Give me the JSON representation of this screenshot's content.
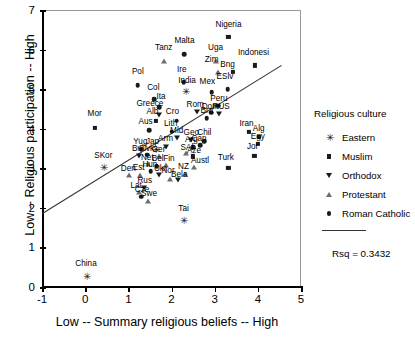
{
  "chart_data": {
    "type": "scatter",
    "title": "",
    "xlabel": "Low -- Summary religious beliefs -- High",
    "ylabel": "Low -- Religious participation -- High",
    "xlim": [
      -1,
      5
    ],
    "ylim": [
      0,
      7
    ],
    "xticks": [
      "-1",
      "0",
      "1",
      "2",
      "3",
      "4",
      "5"
    ],
    "yticks": [
      "0",
      "1",
      "2",
      "3",
      "4",
      "5",
      "6",
      "7"
    ],
    "grid": false,
    "legend_position": "right",
    "fit_line": {
      "x0": -1.0,
      "y0": 1.85,
      "x1": 4.55,
      "y1": 5.6,
      "rsq": "Rsq = 0.3432"
    },
    "series": [
      {
        "name": "Eastern",
        "marker": "asterisk",
        "color": "#1a1a1a"
      },
      {
        "name": "Muslim",
        "marker": "square",
        "color": "#1a1a1a"
      },
      {
        "name": "Orthodox",
        "marker": "triangle-down",
        "color": "#1a1a1a"
      },
      {
        "name": "Protestant",
        "marker": "triangle-up",
        "color": "#6e6e6e"
      },
      {
        "name": "Roman Catholic",
        "marker": "circle",
        "color": "#1a1a1a"
      }
    ],
    "points": [
      {
        "label": "Nigeria",
        "x": 3.32,
        "y": 6.32,
        "group": "Muslim",
        "lx": 3.32,
        "ly": 6.62
      },
      {
        "label": "Malta",
        "x": 2.3,
        "y": 5.88,
        "group": "Roman Catholic",
        "lx": 2.3,
        "ly": 6.22
      },
      {
        "label": "Tanz",
        "x": 1.82,
        "y": 5.72,
        "group": "Protestant",
        "lx": 1.82,
        "ly": 6.05
      },
      {
        "label": "Uga",
        "x": 3.02,
        "y": 5.72,
        "group": "Protestant",
        "lx": 3.02,
        "ly": 6.05
      },
      {
        "label": "Indonesi",
        "x": 3.93,
        "y": 5.6,
        "group": "Muslim",
        "lx": 3.9,
        "ly": 5.92
      },
      {
        "label": "Zim",
        "x": 3.08,
        "y": 5.44,
        "group": "Protestant",
        "lx": 2.93,
        "ly": 5.74
      },
      {
        "label": "Bng",
        "x": 3.42,
        "y": 5.44,
        "group": "Muslim",
        "lx": 3.3,
        "ly": 5.6
      },
      {
        "label": "Ire",
        "x": 2.28,
        "y": 5.18,
        "group": "Roman Catholic",
        "lx": 2.24,
        "ly": 5.48
      },
      {
        "label": "Pol",
        "x": 1.22,
        "y": 5.1,
        "group": "Roman Catholic",
        "lx": 1.22,
        "ly": 5.44
      },
      {
        "label": "India",
        "x": 2.33,
        "y": 4.95,
        "group": "Eastern",
        "lx": 2.36,
        "ly": 5.2
      },
      {
        "label": "ESlv",
        "x": 3.3,
        "y": 5.0,
        "group": "Roman Catholic",
        "lx": 3.24,
        "ly": 5.3
      },
      {
        "label": "Mex",
        "x": 2.93,
        "y": 4.92,
        "group": "Roman Catholic",
        "lx": 2.83,
        "ly": 5.18
      },
      {
        "label": "Col",
        "x": 1.6,
        "y": 4.75,
        "group": "Roman Catholic",
        "lx": 1.58,
        "ly": 5.02
      },
      {
        "label": "Ita",
        "x": 1.72,
        "y": 4.55,
        "group": "Roman Catholic",
        "lx": 1.76,
        "ly": 4.8
      },
      {
        "label": "Peru",
        "x": 3.08,
        "y": 4.58,
        "group": "Roman Catholic",
        "lx": 3.1,
        "ly": 4.76
      },
      {
        "label": "Greece",
        "x": 1.7,
        "y": 4.35,
        "group": "Orthodox",
        "lx": 1.5,
        "ly": 4.62
      },
      {
        "label": "Rom",
        "x": 2.58,
        "y": 4.42,
        "group": "Orthodox",
        "lx": 2.55,
        "ly": 4.6
      },
      {
        "label": "Dom",
        "x": 2.92,
        "y": 4.4,
        "group": "Roman Catholic",
        "lx": 2.9,
        "ly": 4.56
      },
      {
        "label": "RUS",
        "x": 3.1,
        "y": 4.38,
        "group": "Orthodox",
        "lx": 3.15,
        "ly": 4.54
      },
      {
        "label": "Bra",
        "x": 2.82,
        "y": 4.26,
        "group": "Roman Catholic",
        "lx": 2.82,
        "ly": 4.44
      },
      {
        "label": "Alb",
        "x": 1.64,
        "y": 4.2,
        "group": "Muslim",
        "lx": 1.56,
        "ly": 4.42
      },
      {
        "label": "Cro",
        "x": 2.12,
        "y": 4.2,
        "group": "Roman Catholic",
        "lx": 2.02,
        "ly": 4.42
      },
      {
        "label": "Mor",
        "x": 0.22,
        "y": 4.02,
        "group": "Muslim",
        "lx": 0.22,
        "ly": 4.36
      },
      {
        "label": "Aus",
        "x": 1.48,
        "y": 3.96,
        "group": "Roman Catholic",
        "lx": 1.4,
        "ly": 4.18
      },
      {
        "label": "Lith",
        "x": 2.0,
        "y": 3.92,
        "group": "Roman Catholic",
        "lx": 1.98,
        "ly": 4.12
      },
      {
        "label": "Mld",
        "x": 2.12,
        "y": 3.76,
        "group": "Orthodox",
        "lx": 2.12,
        "ly": 3.94
      },
      {
        "label": "Geo",
        "x": 2.46,
        "y": 3.72,
        "group": "Orthodox",
        "lx": 2.46,
        "ly": 3.9
      },
      {
        "label": "Iran",
        "x": 3.8,
        "y": 3.92,
        "group": "Muslim",
        "lx": 3.74,
        "ly": 4.12
      },
      {
        "label": "Alg",
        "x": 4.02,
        "y": 3.8,
        "group": "Muslim",
        "lx": 4.02,
        "ly": 4.0
      },
      {
        "label": "Egy",
        "x": 4.0,
        "y": 3.62,
        "group": "Muslim",
        "lx": 4.0,
        "ly": 3.8
      },
      {
        "label": "Chil",
        "x": 2.76,
        "y": 3.68,
        "group": "Roman Catholic",
        "lx": 2.76,
        "ly": 3.88
      },
      {
        "label": "Can",
        "x": 2.66,
        "y": 3.58,
        "group": "Roman Catholic",
        "lx": 2.64,
        "ly": 3.74
      },
      {
        "label": "Arg",
        "x": 2.5,
        "y": 3.54,
        "group": "Roman Catholic",
        "lx": 2.46,
        "ly": 3.72
      },
      {
        "label": "Arm",
        "x": 1.88,
        "y": 3.54,
        "group": "Orthodox",
        "lx": 1.86,
        "ly": 3.74
      },
      {
        "label": "Jap",
        "x": 1.62,
        "y": 3.48,
        "group": "Eastern",
        "lx": 1.56,
        "ly": 3.66
      },
      {
        "label": "Yug",
        "x": 1.3,
        "y": 3.46,
        "group": "Orthodox",
        "lx": 1.28,
        "ly": 3.66
      },
      {
        "label": "Jor",
        "x": 3.92,
        "y": 3.32,
        "group": "Muslim",
        "lx": 3.88,
        "ly": 3.54
      },
      {
        "label": "SAf",
        "x": 2.34,
        "y": 3.38,
        "group": "Protestant",
        "lx": 2.36,
        "ly": 3.52
      },
      {
        "label": "Aze",
        "x": 2.5,
        "y": 3.3,
        "group": "Muslim",
        "lx": 2.52,
        "ly": 3.44
      },
      {
        "label": "Slvk",
        "x": 1.44,
        "y": 3.34,
        "group": "Roman Catholic",
        "lx": 1.42,
        "ly": 3.5
      },
      {
        "label": "Bul",
        "x": 1.24,
        "y": 3.32,
        "group": "Orthodox",
        "lx": 1.22,
        "ly": 3.5
      },
      {
        "label": "Ger",
        "x": 1.7,
        "y": 3.3,
        "group": "Protestant",
        "lx": 1.7,
        "ly": 3.46
      },
      {
        "label": "SKor",
        "x": 0.42,
        "y": 3.02,
        "group": "Eastern",
        "lx": 0.42,
        "ly": 3.32
      },
      {
        "label": "Turk",
        "x": 3.32,
        "y": 3.0,
        "group": "Muslim",
        "lx": 3.26,
        "ly": 3.26
      },
      {
        "label": "Net",
        "x": 1.46,
        "y": 3.1,
        "group": "Protestant",
        "lx": 1.44,
        "ly": 3.26
      },
      {
        "label": "Bel",
        "x": 1.66,
        "y": 3.06,
        "group": "Roman Catholic",
        "lx": 1.68,
        "ly": 3.24
      },
      {
        "label": "Fin",
        "x": 1.88,
        "y": 3.08,
        "group": "Protestant",
        "lx": 1.94,
        "ly": 3.24
      },
      {
        "label": "Austl",
        "x": 2.52,
        "y": 3.02,
        "group": "Protestant",
        "lx": 2.66,
        "ly": 3.18
      },
      {
        "label": "Hun",
        "x": 1.52,
        "y": 2.92,
        "group": "Roman Catholic",
        "lx": 1.5,
        "ly": 3.08
      },
      {
        "label": "Est",
        "x": 1.26,
        "y": 2.84,
        "group": "Protestant",
        "lx": 1.24,
        "ly": 3.0
      },
      {
        "label": "Den",
        "x": 1.02,
        "y": 2.82,
        "group": "Protestant",
        "lx": 1.0,
        "ly": 2.98
      },
      {
        "label": "Ukr",
        "x": 1.72,
        "y": 2.82,
        "group": "Orthodox",
        "lx": 1.74,
        "ly": 2.98
      },
      {
        "label": "NZ",
        "x": 2.32,
        "y": 2.86,
        "group": "Protestant",
        "lx": 2.28,
        "ly": 3.04
      },
      {
        "label": "Nor",
        "x": 1.96,
        "y": 2.74,
        "group": "Protestant",
        "lx": 1.92,
        "ly": 2.92
      },
      {
        "label": "Bela",
        "x": 2.14,
        "y": 2.7,
        "group": "Orthodox",
        "lx": 2.18,
        "ly": 2.84
      },
      {
        "label": "Rus",
        "x": 1.36,
        "y": 2.5,
        "group": "Orthodox",
        "lx": 1.38,
        "ly": 2.68
      },
      {
        "label": "Lat",
        "x": 1.24,
        "y": 2.4,
        "group": "Protestant",
        "lx": 1.18,
        "ly": 2.56
      },
      {
        "label": "Cze",
        "x": 1.3,
        "y": 2.28,
        "group": "Roman Catholic",
        "lx": 1.32,
        "ly": 2.44
      },
      {
        "label": "Swe",
        "x": 1.46,
        "y": 2.18,
        "group": "Protestant",
        "lx": 1.48,
        "ly": 2.36
      },
      {
        "label": "Tai",
        "x": 2.28,
        "y": 1.7,
        "group": "Eastern",
        "lx": 2.28,
        "ly": 1.98
      },
      {
        "label": "China",
        "x": 0.02,
        "y": 0.28,
        "group": "Eastern",
        "lx": 0.02,
        "ly": 0.58
      }
    ]
  },
  "legend": {
    "title": "Religious culture",
    "items": [
      {
        "label": "Eastern",
        "marker": "asterisk"
      },
      {
        "label": "Muslim",
        "marker": "square"
      },
      {
        "label": "Orthodox",
        "marker": "triangle-down"
      },
      {
        "label": "Protestant",
        "marker": "triangle-up"
      },
      {
        "label": "Roman Catholic",
        "marker": "circle"
      }
    ],
    "fit_label": "Rsq = 0.3432"
  }
}
